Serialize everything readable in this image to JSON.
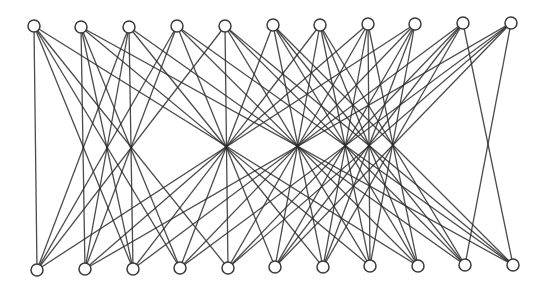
{
  "diagram": {
    "type": "bipartite-graph",
    "colors": {
      "edge": "#2b2b2b",
      "node_fill": "#ffffff",
      "node_stroke": "#3a3a3a",
      "background": "#ffffff"
    },
    "node_radius": 6,
    "top_nodes": [
      {
        "id": "t0",
        "x": 34,
        "y": 26
      },
      {
        "id": "t1",
        "x": 81,
        "y": 27
      },
      {
        "id": "t2",
        "x": 129,
        "y": 27
      },
      {
        "id": "t3",
        "x": 177,
        "y": 26
      },
      {
        "id": "t4",
        "x": 225,
        "y": 26
      },
      {
        "id": "t5",
        "x": 273,
        "y": 25
      },
      {
        "id": "t6",
        "x": 320,
        "y": 25
      },
      {
        "id": "t7",
        "x": 368,
        "y": 24
      },
      {
        "id": "t8",
        "x": 415,
        "y": 24
      },
      {
        "id": "t9",
        "x": 463,
        "y": 23
      },
      {
        "id": "t10",
        "x": 511,
        "y": 23
      }
    ],
    "bottom_nodes": [
      {
        "id": "b0",
        "x": 37,
        "y": 270
      },
      {
        "id": "b1",
        "x": 85,
        "y": 269
      },
      {
        "id": "b2",
        "x": 133,
        "y": 269
      },
      {
        "id": "b3",
        "x": 180,
        "y": 268
      },
      {
        "id": "b4",
        "x": 228,
        "y": 268
      },
      {
        "id": "b5",
        "x": 275,
        "y": 267
      },
      {
        "id": "b6",
        "x": 323,
        "y": 267
      },
      {
        "id": "b7",
        "x": 370,
        "y": 266
      },
      {
        "id": "b8",
        "x": 418,
        "y": 266
      },
      {
        "id": "b9",
        "x": 465,
        "y": 265
      },
      {
        "id": "b10",
        "x": 513,
        "y": 265
      }
    ],
    "edge_index_sums": [
      0,
      2,
      3,
      4,
      8,
      11,
      13,
      14,
      15,
      19
    ],
    "edge_rule": "top i connects to bottom j when i + j is in edge_index_sums"
  }
}
